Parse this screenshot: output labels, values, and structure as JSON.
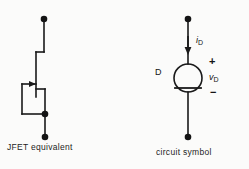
{
  "figure": {
    "background_color": "#fbfbfa",
    "line_color": "#1a1a1a"
  },
  "panels": {
    "left": {
      "caption": "JFET equivalent",
      "description": "JFET equivalent circuit with gate tied to source",
      "elements": {
        "top_terminal": "drain-terminal-dot",
        "bottom_terminal": "source-terminal-dot",
        "junction": "gate-source-junction-dot",
        "channel": "jfet-channel-bar",
        "gate_arrow": "gate-arrow"
      }
    },
    "right": {
      "caption": "circuit symbol",
      "description": "Current source symbol with diode bar",
      "labels": {
        "current": "i",
        "current_sub": "D",
        "voltage": "v",
        "voltage_sub": "D",
        "device": "D",
        "polarity_plus": "+",
        "polarity_minus": "−"
      },
      "elements": {
        "top_terminal": "anode-terminal-dot",
        "bottom_terminal": "cathode-terminal-dot",
        "body": "source-circle",
        "bar": "cathode-bar",
        "current_arrow": "current-direction-arrow"
      }
    }
  }
}
